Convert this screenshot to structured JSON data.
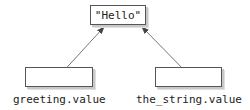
{
  "diagram": {
    "target": {
      "value": "\"Hello\""
    },
    "references": [
      {
        "name": "greeting.value"
      },
      {
        "name": "the_string.value"
      }
    ]
  }
}
